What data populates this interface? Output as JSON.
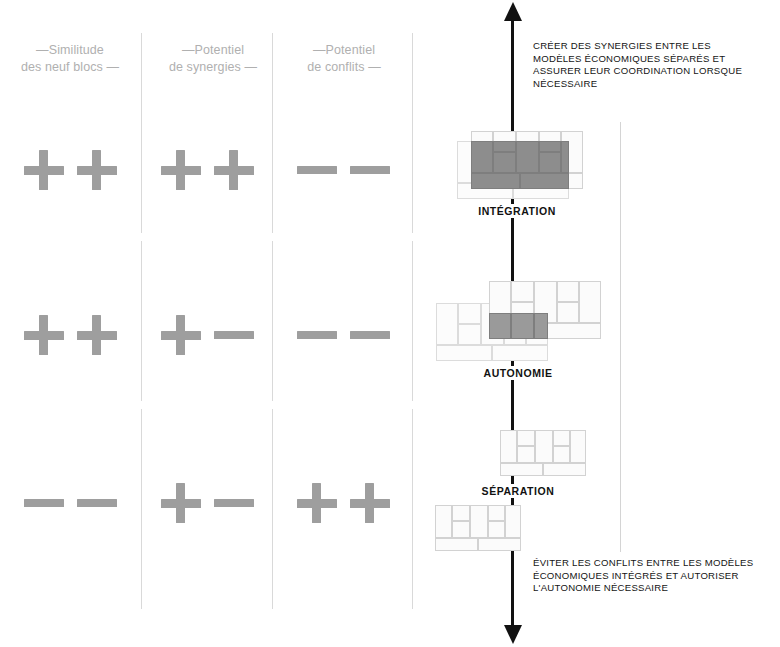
{
  "columns": [
    {
      "id": "similitude",
      "label": "—Similitude\ndes neuf blocs —"
    },
    {
      "id": "synergies",
      "label": "—Potentiel\nde synergies —"
    },
    {
      "id": "conflits",
      "label": "—Potentiel\nde conflits —"
    }
  ],
  "rows": [
    {
      "id": "integration",
      "stage_label": "INTÉGRATION",
      "ratings": [
        {
          "column": "similitude",
          "value": "++",
          "symbols": [
            "plus",
            "plus"
          ]
        },
        {
          "column": "synergies",
          "value": "++",
          "symbols": [
            "plus",
            "plus"
          ]
        },
        {
          "column": "conflits",
          "value": "--",
          "symbols": [
            "minus",
            "minus"
          ]
        }
      ]
    },
    {
      "id": "autonomie",
      "stage_label": "AUTONOMIE",
      "ratings": [
        {
          "column": "similitude",
          "value": "++",
          "symbols": [
            "plus",
            "plus"
          ]
        },
        {
          "column": "synergies",
          "value": "+-",
          "symbols": [
            "plus",
            "minus"
          ]
        },
        {
          "column": "conflits",
          "value": "--",
          "symbols": [
            "minus",
            "minus"
          ]
        }
      ]
    },
    {
      "id": "separation",
      "stage_label": "SÉPARATION",
      "ratings": [
        {
          "column": "similitude",
          "value": "--",
          "symbols": [
            "minus",
            "minus"
          ]
        },
        {
          "column": "synergies",
          "value": "+-",
          "symbols": [
            "plus",
            "minus"
          ]
        },
        {
          "column": "conflits",
          "value": "++",
          "symbols": [
            "plus",
            "plus"
          ]
        }
      ]
    }
  ],
  "annotations": {
    "top": "CRÉER DES SYNERGIES ENTRE LES\nMODÈLES ÉCONOMIQUES SÉPARÉS ET\nASSURER LEUR COORDINATION LORSQUE\nNÉCESSAIRE",
    "bottom": "ÉVITER LES CONFLITS ENTRE LES MODÈLES\nÉCONOMIQUES INTÉGRÉS ET AUTORISER\nL'AUTONOMIE NÉCESSAIRE"
  },
  "axis": {
    "name": "integration-autonomy-axis",
    "direction": "double-headed-vertical"
  },
  "colors": {
    "glyph": "#9e9e9e",
    "header_text": "#b0b0b0",
    "rule": "#d9d9d9",
    "axis": "#111111",
    "canvas_border": "#d2d2d2",
    "overlap_fill": "#8f8f8f"
  }
}
